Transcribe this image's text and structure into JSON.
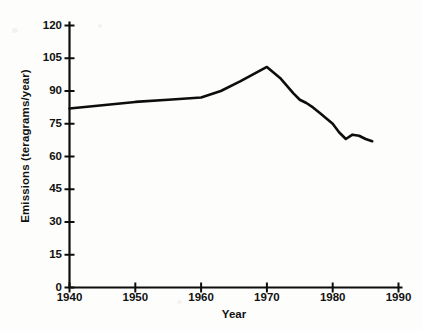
{
  "chart_data": {
    "type": "line",
    "title": "",
    "xlabel": "Year",
    "ylabel": "Emissions (teragrams/year)",
    "xlim": [
      1940,
      1990
    ],
    "ylim": [
      0,
      120
    ],
    "grid": false,
    "legend": "none",
    "xticks": [
      "1940",
      "1950",
      "1960",
      "1970",
      "1980",
      "1990"
    ],
    "xtick_values": [
      1940,
      1950,
      1960,
      1970,
      1980,
      1990
    ],
    "yticks": [
      "0",
      "15",
      "30",
      "45",
      "60",
      "75",
      "90",
      "105",
      "120"
    ],
    "ytick_values": [
      0,
      15,
      30,
      45,
      60,
      75,
      90,
      105,
      120
    ],
    "series": [
      {
        "name": "Emissions",
        "color": "#0d0d0d",
        "x": [
          1940,
          1945,
          1950,
          1955,
          1960,
          1963,
          1966,
          1970,
          1972,
          1974,
          1975,
          1976,
          1977,
          1978,
          1979,
          1980,
          1981,
          1982,
          1983,
          1984,
          1985,
          1986
        ],
        "values": [
          82,
          83.5,
          85,
          86,
          87,
          90,
          94.5,
          101,
          96,
          89,
          86,
          84.5,
          82.5,
          80,
          77.5,
          75,
          71,
          68,
          70,
          69.5,
          68,
          67
        ]
      }
    ]
  },
  "axis": {
    "line_color": "#0d0d0d",
    "tick_color": "#0d0d0d"
  }
}
